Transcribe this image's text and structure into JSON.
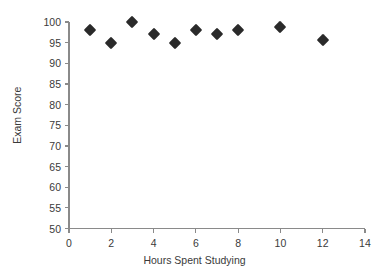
{
  "chart_data": {
    "type": "scatter",
    "title": "",
    "xlabel": "Hours Spent Studying",
    "ylabel": "Exam Score",
    "xlim": [
      0,
      14
    ],
    "ylim": [
      50,
      100
    ],
    "xticks": [
      0,
      2,
      4,
      6,
      8,
      10,
      12,
      14
    ],
    "yticks": [
      50,
      55,
      60,
      65,
      70,
      75,
      80,
      85,
      90,
      95,
      100
    ],
    "xtick_labels": [
      "0",
      "2",
      "4",
      "6",
      "8",
      "10",
      "12",
      "14"
    ],
    "ytick_labels": [
      "50",
      "55",
      "60",
      "65",
      "70",
      "75",
      "80",
      "85",
      "90",
      "95",
      "100"
    ],
    "grid": false,
    "legend": null,
    "marker": "diamond",
    "marker_color": "#2a2a2a",
    "x": [
      1,
      2,
      3,
      4,
      5,
      6,
      7,
      8,
      10,
      12
    ],
    "y": [
      98,
      95,
      100,
      97,
      95,
      98,
      97,
      98,
      98.7,
      95.7
    ],
    "points": [
      {
        "x": 1,
        "y": 98
      },
      {
        "x": 2,
        "y": 95
      },
      {
        "x": 3,
        "y": 100
      },
      {
        "x": 4,
        "y": 97
      },
      {
        "x": 5,
        "y": 95
      },
      {
        "x": 6,
        "y": 98
      },
      {
        "x": 7,
        "y": 97
      },
      {
        "x": 8,
        "y": 98
      },
      {
        "x": 10,
        "y": 98.7
      },
      {
        "x": 12,
        "y": 95.7
      }
    ]
  }
}
